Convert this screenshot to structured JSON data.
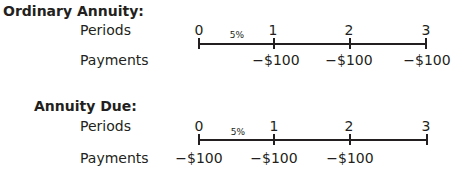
{
  "ordinary": {
    "title": "Ordinary Annuity:",
    "periods_label": "Periods",
    "payments_label": "Payments",
    "rate": "5%",
    "periods": [
      "0",
      "1",
      "2",
      "3"
    ],
    "payments": [
      "",
      "−$100",
      "−$100",
      "−$100"
    ]
  },
  "due": {
    "title": "Annuity Due:",
    "periods_label": "Periods",
    "payments_label": "Payments",
    "rate": "5%",
    "periods": [
      "0",
      "1",
      "2",
      "3"
    ],
    "payments": [
      "−$100",
      "−$100",
      "−$100",
      ""
    ]
  }
}
